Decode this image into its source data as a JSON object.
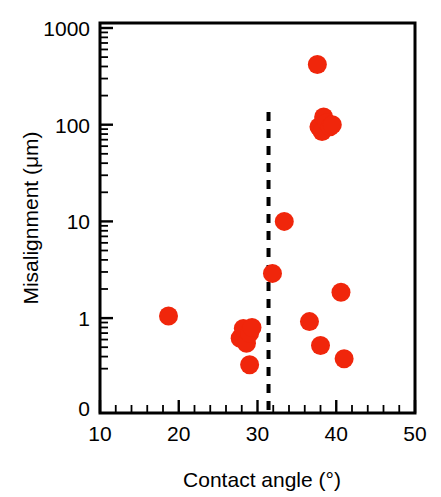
{
  "chart_data": {
    "type": "scatter",
    "title": "",
    "xlabel": "Contact angle (°)",
    "ylabel": "Misalignment (μm)",
    "xscale": "linear",
    "yscale": "log",
    "xlim": [
      10,
      50
    ],
    "ylim": [
      0.2,
      1000
    ],
    "grid": false,
    "legend": null,
    "xticks": [
      10,
      20,
      30,
      40,
      50
    ],
    "xtick_labels": [
      "10",
      "20",
      "30",
      "40",
      "50"
    ],
    "xminor_interval": 2,
    "yticks": [
      1,
      10,
      100,
      1000
    ],
    "ytick_labels": [
      "1",
      "10",
      "100",
      "1000"
    ],
    "y_origin_label": "0",
    "marker_color": "#F0260B",
    "marker_shape": "circle",
    "marker_size_px": 19,
    "annotations": [
      {
        "name": "threshold-dashed-line",
        "type": "vline",
        "x": 31.4,
        "style": "dashed",
        "color": "#000000",
        "label": ""
      }
    ],
    "series": [
      {
        "name": "Misalignment vs contact angle",
        "color": "#F0260B",
        "points": [
          {
            "x": 18.7,
            "y": 1.05
          },
          {
            "x": 27.8,
            "y": 0.62
          },
          {
            "x": 28.2,
            "y": 0.78
          },
          {
            "x": 28.6,
            "y": 0.55
          },
          {
            "x": 29.0,
            "y": 0.7
          },
          {
            "x": 29.3,
            "y": 0.8
          },
          {
            "x": 29.0,
            "y": 0.33
          },
          {
            "x": 31.9,
            "y": 2.9
          },
          {
            "x": 33.4,
            "y": 10.0
          },
          {
            "x": 36.6,
            "y": 0.92
          },
          {
            "x": 37.6,
            "y": 420.0
          },
          {
            "x": 37.8,
            "y": 95.0
          },
          {
            "x": 38.2,
            "y": 85.0
          },
          {
            "x": 38.4,
            "y": 120.0
          },
          {
            "x": 38.8,
            "y": 105.0
          },
          {
            "x": 39.2,
            "y": 95.0
          },
          {
            "x": 39.5,
            "y": 100.0
          },
          {
            "x": 38.0,
            "y": 0.52
          },
          {
            "x": 40.6,
            "y": 1.85
          },
          {
            "x": 41.0,
            "y": 0.38
          }
        ]
      }
    ]
  },
  "figure": {
    "plot_area": {
      "left": 100,
      "top": 23,
      "right": 415,
      "bottom": 413
    }
  }
}
